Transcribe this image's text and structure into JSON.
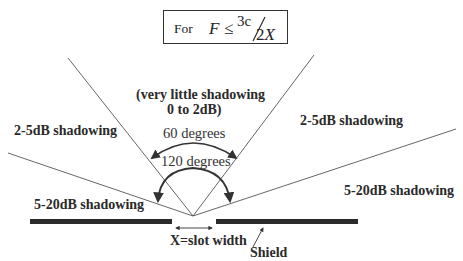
{
  "formula": {
    "prefix": "For",
    "variable": "F",
    "operator": "≤",
    "numerator": "3c",
    "denominator_coef": "2",
    "denominator_var": "X"
  },
  "regions": {
    "center_line1": "(very little shadowing",
    "center_line2": "0 to 2dB)",
    "upper_left": "2-5dB shadowing",
    "upper_right": "2-5dB shadowing",
    "lower_left": "5-20dB shadowing",
    "lower_right": "5-20dB shadowing"
  },
  "angles": {
    "inner": "60 degrees",
    "outer": "120 degrees"
  },
  "annotations": {
    "slot_width": "X=slot width",
    "shield": "Shield"
  },
  "colors": {
    "line": "#555555",
    "shield": "#2b2b2b",
    "arrow": "#333333",
    "text": "#222222"
  }
}
